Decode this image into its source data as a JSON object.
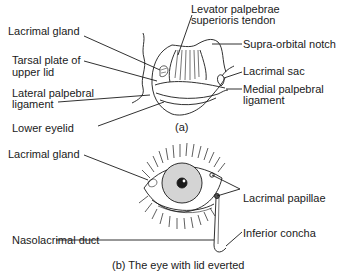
{
  "diagram_a": {
    "caption": "(a)",
    "labels": {
      "lacrimal_gland": "Lacrimal gland",
      "tarsal_plate_1": "Tarsal plate of",
      "tarsal_plate_2": "upper lid",
      "lateral_lig_1": "Lateral palpebral",
      "lateral_lig_2": "ligament",
      "lower_eyelid": "Lower eyelid",
      "levator_1": "Levator palpebrae",
      "levator_2": "superioris tendon",
      "supra_orbital": "Supra-orbital notch",
      "lacrimal_sac": "Lacrimal sac",
      "medial_lig_1": "Medial palpebral",
      "medial_lig_2": "ligament"
    }
  },
  "diagram_b": {
    "caption": "(b) The eye with lid everted",
    "labels": {
      "lacrimal_gland": "Lacrimal gland",
      "lacrimal_papillae": "Lacrimal papillae",
      "nasolacrimal_duct": "Nasolacrimal duct",
      "inferior_concha": "Inferior concha"
    }
  }
}
